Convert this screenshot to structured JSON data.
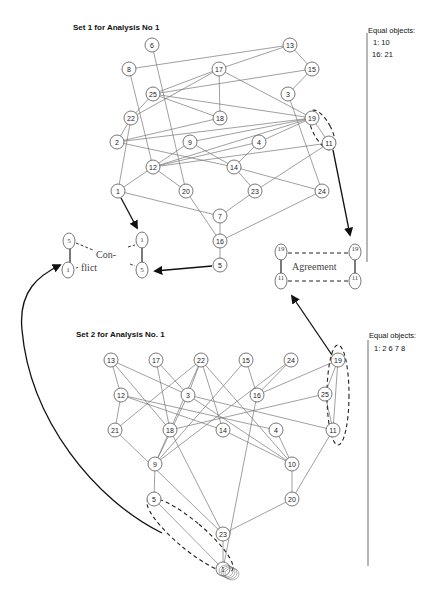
{
  "set1": {
    "title": "Set 1 for Analysis No 1",
    "equal_objects": {
      "heading": "Equal objects:",
      "rows": [
        "1:   10",
        "16: 21"
      ]
    },
    "nodes": [
      {
        "id": "6",
        "x": 152,
        "y": 45
      },
      {
        "id": "13",
        "x": 290,
        "y": 45
      },
      {
        "id": "8",
        "x": 129,
        "y": 69
      },
      {
        "id": "17",
        "x": 219,
        "y": 69
      },
      {
        "id": "15",
        "x": 312,
        "y": 69
      },
      {
        "id": "25",
        "x": 153,
        "y": 94
      },
      {
        "id": "3",
        "x": 288,
        "y": 94
      },
      {
        "id": "22",
        "x": 131,
        "y": 118
      },
      {
        "id": "18",
        "x": 220,
        "y": 118
      },
      {
        "id": "19",
        "x": 312,
        "y": 118
      },
      {
        "id": "2",
        "x": 117,
        "y": 142
      },
      {
        "id": "9",
        "x": 190,
        "y": 142
      },
      {
        "id": "4",
        "x": 259,
        "y": 142
      },
      {
        "id": "11",
        "x": 329,
        "y": 143
      },
      {
        "id": "12",
        "x": 153,
        "y": 167
      },
      {
        "id": "14",
        "x": 234,
        "y": 167
      },
      {
        "id": "1",
        "x": 118,
        "y": 191
      },
      {
        "id": "20",
        "x": 186,
        "y": 191
      },
      {
        "id": "23",
        "x": 255,
        "y": 191
      },
      {
        "id": "24",
        "x": 322,
        "y": 191
      },
      {
        "id": "7",
        "x": 220,
        "y": 216
      },
      {
        "id": "16",
        "x": 220,
        "y": 241
      },
      {
        "id": "5",
        "x": 220,
        "y": 265
      }
    ],
    "edges": [
      [
        "8",
        "13"
      ],
      [
        "13",
        "17"
      ],
      [
        "13",
        "15"
      ],
      [
        "15",
        "3"
      ],
      [
        "17",
        "25"
      ],
      [
        "17",
        "22"
      ],
      [
        "17",
        "18"
      ],
      [
        "17",
        "19"
      ],
      [
        "25",
        "15"
      ],
      [
        "25",
        "18"
      ],
      [
        "25",
        "19"
      ],
      [
        "25",
        "22"
      ],
      [
        "22",
        "2"
      ],
      [
        "22",
        "1"
      ],
      [
        "6",
        "20"
      ],
      [
        "8",
        "12"
      ],
      [
        "18",
        "2"
      ],
      [
        "2",
        "14"
      ],
      [
        "2",
        "19"
      ],
      [
        "9",
        "12"
      ],
      [
        "9",
        "14"
      ],
      [
        "9",
        "19"
      ],
      [
        "19",
        "4"
      ],
      [
        "19",
        "12"
      ],
      [
        "19",
        "11"
      ],
      [
        "4",
        "12"
      ],
      [
        "4",
        "14"
      ],
      [
        "11",
        "12"
      ],
      [
        "11",
        "23"
      ],
      [
        "3",
        "24"
      ],
      [
        "12",
        "1"
      ],
      [
        "12",
        "20"
      ],
      [
        "14",
        "23"
      ],
      [
        "14",
        "24"
      ],
      [
        "1",
        "7"
      ],
      [
        "20",
        "16"
      ],
      [
        "23",
        "7"
      ],
      [
        "7",
        "16"
      ],
      [
        "24",
        "16"
      ],
      [
        "16",
        "5"
      ]
    ]
  },
  "set2": {
    "title": "Set 2 for Analysis No. 1",
    "equal_objects": {
      "heading": "Equal objects:",
      "rows": [
        "1:  2   6   7   8"
      ]
    },
    "nodes": [
      {
        "id": "13",
        "x": 111,
        "y": 360
      },
      {
        "id": "17",
        "x": 156,
        "y": 360
      },
      {
        "id": "22",
        "x": 201,
        "y": 360
      },
      {
        "id": "15",
        "x": 246,
        "y": 360
      },
      {
        "id": "24",
        "x": 291,
        "y": 360
      },
      {
        "id": "19",
        "x": 338,
        "y": 360
      },
      {
        "id": "12",
        "x": 121,
        "y": 395
      },
      {
        "id": "3",
        "x": 188,
        "y": 395
      },
      {
        "id": "16",
        "x": 257,
        "y": 395
      },
      {
        "id": "25",
        "x": 325,
        "y": 394
      },
      {
        "id": "21",
        "x": 115,
        "y": 430
      },
      {
        "id": "18",
        "x": 170,
        "y": 430
      },
      {
        "id": "14",
        "x": 223,
        "y": 430
      },
      {
        "id": "4",
        "x": 276,
        "y": 430
      },
      {
        "id": "11",
        "x": 333,
        "y": 430
      },
      {
        "id": "9",
        "x": 155,
        "y": 464
      },
      {
        "id": "10",
        "x": 292,
        "y": 464
      },
      {
        "id": "5",
        "x": 154,
        "y": 499
      },
      {
        "id": "20",
        "x": 292,
        "y": 499
      },
      {
        "id": "23",
        "x": 223,
        "y": 534
      },
      {
        "id": "1",
        "x": 223,
        "y": 569
      }
    ],
    "edges": [
      [
        "13",
        "12"
      ],
      [
        "13",
        "3"
      ],
      [
        "13",
        "18"
      ],
      [
        "17",
        "18"
      ],
      [
        "17",
        "3"
      ],
      [
        "22",
        "21"
      ],
      [
        "22",
        "3"
      ],
      [
        "22",
        "18"
      ],
      [
        "22",
        "14"
      ],
      [
        "22",
        "10"
      ],
      [
        "15",
        "16"
      ],
      [
        "15",
        "9"
      ],
      [
        "24",
        "16"
      ],
      [
        "24",
        "9"
      ],
      [
        "19",
        "16"
      ],
      [
        "19",
        "25"
      ],
      [
        "19",
        "11"
      ],
      [
        "12",
        "21"
      ],
      [
        "12",
        "4"
      ],
      [
        "12",
        "14"
      ],
      [
        "3",
        "11"
      ],
      [
        "3",
        "10"
      ],
      [
        "3",
        "9"
      ],
      [
        "25",
        "18"
      ],
      [
        "25",
        "11"
      ],
      [
        "21",
        "23"
      ],
      [
        "18",
        "9"
      ],
      [
        "18",
        "23"
      ],
      [
        "14",
        "10"
      ],
      [
        "4",
        "10"
      ],
      [
        "11",
        "20"
      ],
      [
        "9",
        "5"
      ],
      [
        "10",
        "20"
      ],
      [
        "20",
        "23"
      ],
      [
        "16",
        "1"
      ],
      [
        "23",
        "1"
      ],
      [
        "5",
        "1"
      ]
    ]
  },
  "conflict": {
    "label_top": "Con-",
    "label_bottom": "flict",
    "left_pair": [
      "5",
      "1"
    ],
    "right_pair": [
      "1",
      "5"
    ]
  },
  "agreement": {
    "label": "Agreement",
    "top_nodes": [
      "19",
      "19"
    ],
    "bottom_nodes": [
      "11",
      "11"
    ]
  }
}
